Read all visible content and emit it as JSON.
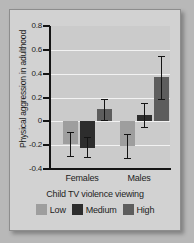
{
  "chart_data": {
    "type": "bar",
    "title": "",
    "xlabel": "Child TV violence viewing",
    "ylabel": "Physical aggression in adulthood",
    "categories": [
      "Females",
      "Males"
    ],
    "ylim": [
      -0.4,
      0.8
    ],
    "yticks": [
      -0.4,
      -0.2,
      0,
      0.2,
      0.4,
      0.6,
      0.8
    ],
    "ytick_labels": [
      "-0.4",
      "-0.2",
      "0",
      "0.2",
      "0.4",
      "0.6",
      "0.8"
    ],
    "grid": true,
    "legend_position": "bottom",
    "series": [
      {
        "name": "Low",
        "color": "#9e9e9e",
        "values": [
          -0.19,
          -0.21
        ],
        "err_low": [
          -0.29,
          -0.31
        ],
        "err_high": [
          -0.09,
          -0.11
        ]
      },
      {
        "name": "Medium",
        "color": "#2d2d2d",
        "values": [
          -0.22,
          0.05
        ],
        "err_low": [
          -0.3,
          -0.05
        ],
        "err_high": [
          -0.13,
          0.15
        ]
      },
      {
        "name": "High",
        "color": "#5d5d5d",
        "values": [
          0.1,
          0.37
        ],
        "err_low": [
          0.01,
          0.19
        ],
        "err_high": [
          0.19,
          0.55
        ]
      }
    ]
  },
  "axis": {
    "y_title": "Physical aggression in adulthood",
    "x_title": "Child TV violence viewing",
    "y_labels": [
      "0.8",
      "0.6",
      "0.4",
      "0.2",
      "0",
      "-0.2",
      "-0.4"
    ],
    "group_labels": [
      "Females",
      "Males"
    ]
  },
  "legend": {
    "items": [
      {
        "label": "Low",
        "color": "#9e9e9e"
      },
      {
        "label": "Medium",
        "color": "#2d2d2d"
      },
      {
        "label": "High",
        "color": "#5d5d5d"
      }
    ]
  },
  "colors": {
    "page_background": "#b8b8b8",
    "card_background": "#d2d2d2",
    "plot_background": "#cbcbcb",
    "gridline": "#f2f2f2",
    "axis": "#141414",
    "text": "#1d1d1d"
  }
}
